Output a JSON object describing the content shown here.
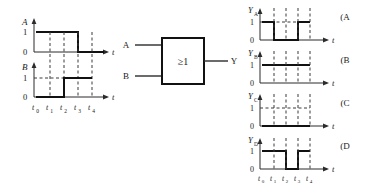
{
  "figure": {
    "title_text": "",
    "colors": {
      "ink": "#1a1a1a",
      "wave": "#111111",
      "axis": "#2b2b2b",
      "grid": "#3a3a3a",
      "background": "#ffffff"
    }
  },
  "input_waveforms": {
    "time_labels": [
      "t0",
      "t1",
      "t2",
      "t3",
      "t4"
    ],
    "time_labels_display": [
      "t",
      "t",
      "t",
      "t",
      "t"
    ],
    "time_subscripts": [
      "0",
      "1",
      "2",
      "3",
      "4"
    ],
    "level_labels": [
      "0",
      "1"
    ],
    "axis_label": "t",
    "channels": [
      {
        "name": "A",
        "label": "A",
        "segments": [
          1,
          1,
          1,
          0
        ],
        "description": "high from t0 to t3, low from t3 to t4"
      },
      {
        "name": "B",
        "label": "B",
        "segments": [
          0,
          0,
          1,
          1
        ],
        "description": "low from t0 to t2, high from t2 to t4"
      }
    ]
  },
  "gate": {
    "symbol": "≥1",
    "symbol_name": "or-gate-iec",
    "inputs": [
      {
        "label": "A"
      },
      {
        "label": "B"
      }
    ],
    "output": {
      "label": "Y"
    }
  },
  "options": {
    "time_labels_display": [
      "t",
      "t",
      "t",
      "t",
      "t"
    ],
    "time_subscripts": [
      "0",
      "1",
      "2",
      "3",
      "4"
    ],
    "level_labels": [
      "0",
      "1"
    ],
    "axis_label": "t",
    "items": [
      {
        "choice_label": "(A",
        "signal_label": "Y",
        "signal_subscript": "A",
        "segments": [
          1,
          0,
          0,
          1
        ],
        "description": "high t0-t1, low t1-t3, high t3-t4"
      },
      {
        "choice_label": "(B",
        "signal_label": "Y",
        "signal_subscript": "B",
        "segments": [
          1,
          1,
          1,
          1
        ],
        "description": "high for the entire interval t0-t4"
      },
      {
        "choice_label": "(C",
        "signal_label": "Y",
        "signal_subscript": "C",
        "segments": [
          0,
          0,
          0,
          0
        ],
        "description": "low for the entire interval t0-t4"
      },
      {
        "choice_label": "(D",
        "signal_label": "Y",
        "signal_subscript": "D",
        "segments": [
          1,
          1,
          0,
          1
        ],
        "description": "high t0-t2, low t2-t3, high t3-t4"
      }
    ]
  }
}
